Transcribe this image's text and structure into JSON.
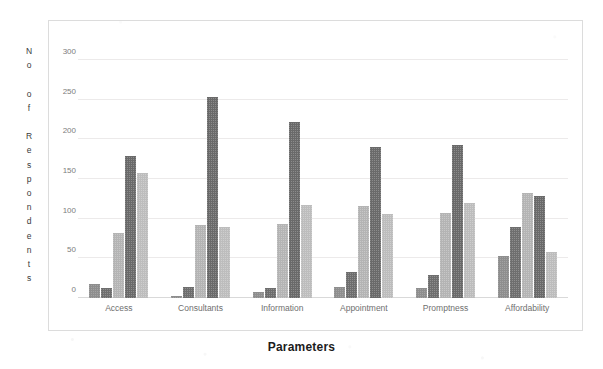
{
  "chart_data": {
    "type": "bar",
    "title": "",
    "xlabel": "Parameters",
    "ylabel": "No of Respondents",
    "ylabel_vertical": "N\no\n\no\nf\n\nR\ne\ns\np\no\nn\nd\ne\nn\nt\ns",
    "categories": [
      "Access",
      "Consultants",
      "Information",
      "Appointment",
      "Promptness",
      "Affordability"
    ],
    "ylim": [
      0,
      300
    ],
    "yticks": [
      0,
      50,
      100,
      150,
      200,
      250,
      300
    ],
    "ytick_labels": [
      "0",
      "50",
      "100",
      "150",
      "200",
      "250",
      "300"
    ],
    "grid": true,
    "grid_axis": "y",
    "legend": "none",
    "series": [
      {
        "name": "Series 1",
        "color": "#8e8e8e",
        "values": [
          18,
          2,
          7,
          14,
          12,
          53
        ]
      },
      {
        "name": "Series 2",
        "color": "#6e6e6e",
        "values": [
          12,
          14,
          13,
          33,
          29,
          90
        ]
      },
      {
        "name": "Series 3",
        "color": "#b4b4b4",
        "values": [
          82,
          92,
          93,
          116,
          107,
          132
        ]
      },
      {
        "name": "Series 4",
        "color": "#6a6a6a",
        "values": [
          179,
          253,
          222,
          190,
          193,
          129
        ]
      },
      {
        "name": "Series 5",
        "color": "#bdbdbd",
        "values": [
          157,
          90,
          117,
          106,
          120,
          58
        ]
      }
    ],
    "colors": {
      "gridline": "#eceaea",
      "baseline": "#d9d9d9",
      "frame": "#dcdcdc",
      "tick_text": "#7d7d7d",
      "axis_title": "#1c1c1c"
    }
  }
}
